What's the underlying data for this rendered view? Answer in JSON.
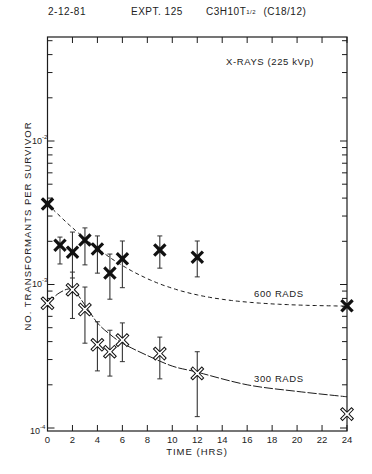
{
  "header": {
    "date": "2-12-81",
    "experiment": "EXPT. 125",
    "cell_line": "C3H10T",
    "cell_line_fraction": "1/2",
    "clone": "(C18/12)"
  },
  "annotations": {
    "radiation": "X-RAYS   (225 kVp)",
    "series_600": "600  RADS",
    "series_300": "300  RADS"
  },
  "chart_data": {
    "type": "scatter",
    "subtitle": "X-RAYS (225 kVp)",
    "xlabel": "TIME   (HRS)",
    "ylabel": "NO.  TRANSFORMANTS  PER  SURVIVOR",
    "xlim": [
      0,
      24
    ],
    "ylim": [
      0.0001,
      0.053
    ],
    "yscale": "log",
    "grid": false,
    "legend": "inline labels on curves",
    "x_ticks": [
      0,
      2,
      4,
      6,
      8,
      10,
      12,
      14,
      16,
      18,
      20,
      22,
      24
    ],
    "x_tick_labels": [
      "0",
      "2",
      "4",
      "6",
      "8",
      "10",
      "12",
      "14",
      "16",
      "18",
      "20",
      "22",
      "24"
    ],
    "y_tick_labels": [
      {
        "value": 0.01,
        "base": "10",
        "exp": "-2"
      },
      {
        "value": 0.001,
        "base": "10",
        "exp": "-3"
      },
      {
        "value": 0.0001,
        "base": "10",
        "exp": "-4"
      }
    ],
    "series": [
      {
        "name": "600 RADS",
        "marker": "filled-x",
        "curve_style": "dashed",
        "x": [
          0,
          1,
          2,
          3,
          4,
          5,
          6,
          9,
          12,
          24
        ],
        "y": [
          0.00364,
          0.00188,
          0.00168,
          0.00204,
          0.00177,
          0.0012,
          0.00151,
          0.00174,
          0.00155,
          0.00071
        ],
        "y_low": [
          null,
          0.00139,
          0.00111,
          0.00137,
          0.0012,
          0.00079,
          0.00095,
          0.0013,
          0.00113,
          null
        ],
        "y_high": [
          null,
          0.00214,
          0.00232,
          0.00248,
          0.00218,
          0.00163,
          0.00201,
          0.00218,
          0.00201,
          null
        ],
        "fit_curve": {
          "type": "exponential-decay",
          "start": 0.00364,
          "plateau": 0.0007,
          "tau_hrs": 4.0
        }
      },
      {
        "name": "300 RADS",
        "marker": "open-x",
        "curve_style": "solid",
        "x": [
          0,
          2,
          3,
          4,
          5,
          6,
          9,
          12,
          24
        ],
        "y": [
          0.00074,
          0.00092,
          0.00067,
          0.00038,
          0.00034,
          0.00041,
          0.00033,
          0.00024,
          0.000125
        ],
        "y_low": [
          null,
          0.00058,
          0.00039,
          0.00025,
          0.00023,
          0.00029,
          0.00022,
          0.00012,
          null
        ],
        "y_high": [
          null,
          0.00122,
          0.00096,
          0.00055,
          0.00048,
          0.00054,
          0.00043,
          0.00034,
          null
        ],
        "fit_curve": {
          "type": "rise-then-decay",
          "points": [
            [
              0,
              0.00074
            ],
            [
              1,
              0.00088
            ],
            [
              2,
              0.00092
            ],
            [
              3,
              0.00072
            ],
            [
              4,
              0.00054
            ],
            [
              5,
              0.00045
            ],
            [
              6,
              0.00039
            ],
            [
              8,
              0.00032
            ],
            [
              10,
              0.00027
            ],
            [
              12,
              0.000245
            ],
            [
              16,
              0.0002
            ],
            [
              20,
              0.00018
            ],
            [
              24,
              0.000165
            ]
          ]
        }
      }
    ]
  }
}
